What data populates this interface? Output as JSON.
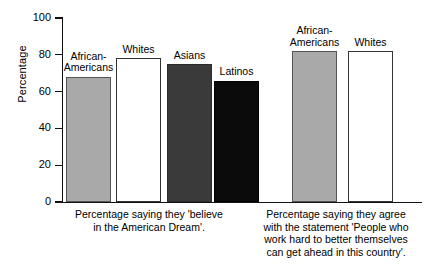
{
  "chart_data": {
    "type": "bar",
    "title": "",
    "xlabel": "",
    "ylabel": "Percentage",
    "ylim": [
      0,
      100
    ],
    "ytick_values": [
      0,
      20,
      40,
      60,
      80,
      100
    ],
    "ytick_labels": [
      "0",
      "20",
      "40",
      "60",
      "80",
      "100"
    ],
    "grid": false,
    "legend": "none",
    "groups": [
      {
        "caption": "Percentage saying they 'believe\nin the American Dream'.",
        "categories": [
          "African-\nAmericans",
          "Whites",
          "Asians",
          "Latinos"
        ],
        "values": [
          68,
          78,
          75,
          66
        ],
        "colors": [
          "#a9a9a9",
          "#ffffff",
          "#3a3a3a",
          "#0b0b0b"
        ]
      },
      {
        "caption": "Percentage saying they agree\nwith the statement 'People who\nwork hard to better themselves\ncan get ahead in this country'.",
        "categories": [
          "African-\nAmericans",
          "Whites"
        ],
        "values": [
          82,
          82
        ],
        "colors": [
          "#a9a9a9",
          "#ffffff"
        ]
      }
    ]
  },
  "axis": {
    "y_label": "Percentage",
    "ticks": [
      {
        "label": "100",
        "value": 100
      },
      {
        "label": "80",
        "value": 80
      },
      {
        "label": "60",
        "value": 60
      },
      {
        "label": "40",
        "value": 40
      },
      {
        "label": "20",
        "value": 20
      },
      {
        "label": "0",
        "value": 0
      }
    ]
  },
  "bars": [
    {
      "name": "african-americans-dream",
      "label": "African-\nAmericans",
      "value": 68,
      "fill": "fill-gray",
      "left": 66,
      "width": 45
    },
    {
      "name": "whites-dream",
      "label": "Whites",
      "value": 78,
      "fill": "fill-white",
      "left": 116,
      "width": 45
    },
    {
      "name": "asians-dream",
      "label": "Asians",
      "value": 75,
      "fill": "fill-dgray",
      "left": 167,
      "width": 45
    },
    {
      "name": "latinos-dream",
      "label": "Latinos",
      "value": 66,
      "fill": "fill-black",
      "left": 214,
      "width": 45
    },
    {
      "name": "african-americans-workhard",
      "label": "African-\nAmericans",
      "value": 82,
      "fill": "fill-gray",
      "left": 292,
      "width": 45
    },
    {
      "name": "whites-workhard",
      "label": "Whites",
      "value": 82,
      "fill": "fill-white",
      "left": 348,
      "width": 45
    }
  ],
  "captions": {
    "left": "Percentage saying they 'believe\nin the American Dream'.",
    "right": "Percentage saying they agree\nwith the statement 'People who\nwork hard to better themselves\ncan get ahead in this country'."
  }
}
